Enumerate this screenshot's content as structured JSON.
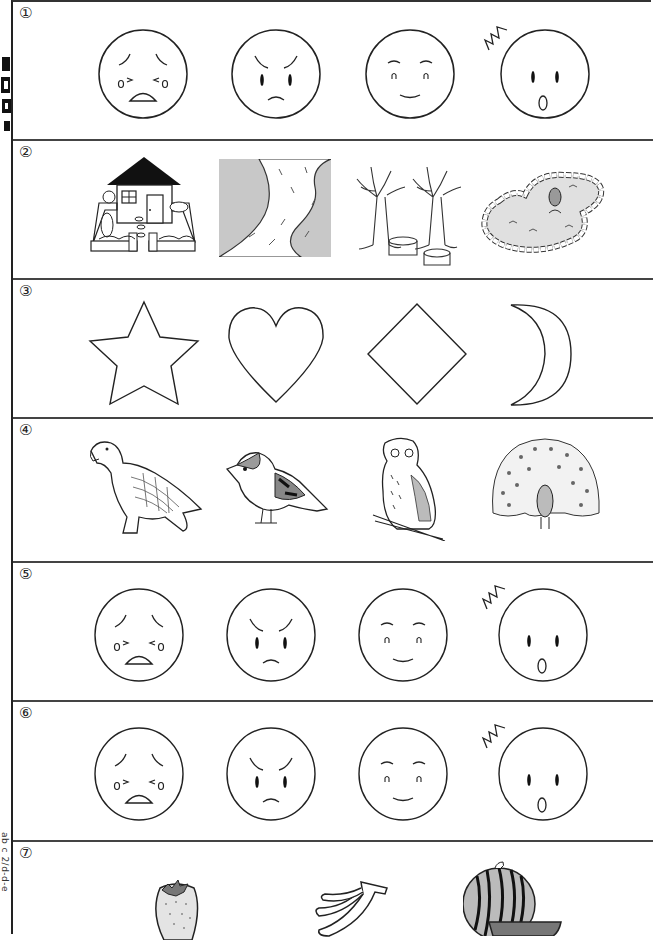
{
  "worksheet": {
    "side_strip": {
      "title_glyphs": "cut-off vertical heading (illegible)",
      "code_text": "ab c 2/d-d-e"
    },
    "rows": [
      {
        "number": "①",
        "theme": "emotion faces",
        "items": [
          {
            "name": "crying-face"
          },
          {
            "name": "angry-face"
          },
          {
            "name": "smiling-face"
          },
          {
            "name": "surprised-face"
          }
        ]
      },
      {
        "number": "②",
        "theme": "places",
        "items": [
          {
            "name": "house-with-garden"
          },
          {
            "name": "river"
          },
          {
            "name": "trees-with-stumps"
          },
          {
            "name": "pond-with-fish"
          }
        ]
      },
      {
        "number": "③",
        "theme": "shapes",
        "items": [
          {
            "name": "star"
          },
          {
            "name": "heart"
          },
          {
            "name": "diamond"
          },
          {
            "name": "crescent-moon"
          }
        ]
      },
      {
        "number": "④",
        "theme": "birds",
        "items": [
          {
            "name": "eagle"
          },
          {
            "name": "sparrow"
          },
          {
            "name": "owl"
          },
          {
            "name": "peacock"
          }
        ]
      },
      {
        "number": "⑤",
        "theme": "emotion faces",
        "items": [
          {
            "name": "crying-face"
          },
          {
            "name": "angry-face"
          },
          {
            "name": "smiling-face"
          },
          {
            "name": "surprised-face"
          }
        ]
      },
      {
        "number": "⑥",
        "theme": "emotion faces",
        "items": [
          {
            "name": "crying-face"
          },
          {
            "name": "angry-face"
          },
          {
            "name": "smiling-face"
          },
          {
            "name": "surprised-face"
          }
        ]
      },
      {
        "number": "⑦",
        "theme": "fruits",
        "items": [
          {
            "name": "strawberry"
          },
          {
            "name": "banana"
          },
          {
            "name": "watermelon"
          }
        ]
      }
    ]
  },
  "colors": {
    "line": "#222222",
    "fill_gray": "#c8c8c8",
    "fill_light": "#e4e4e4"
  }
}
